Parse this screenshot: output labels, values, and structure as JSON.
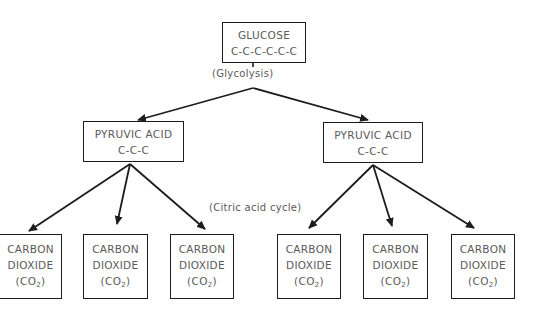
{
  "diagram": {
    "glucose": {
      "name": "GLUCOSE",
      "formula": "C-C-C-C-C-C"
    },
    "glycolysis_label": "(Glycolysis)",
    "citric_label": "(Citric acid cycle)",
    "pyruvic": [
      {
        "name": "PYRUVIC ACID",
        "formula": "C-C-C"
      },
      {
        "name": "PYRUVIC ACID",
        "formula": "C-C-C"
      }
    ],
    "co2": [
      {
        "line1": "CARBON",
        "line2": "DIOXIDE",
        "open": "(CO",
        "sub": "2",
        "close": ")"
      },
      {
        "line1": "CARBON",
        "line2": "DIOXIDE",
        "open": "(CO",
        "sub": "2",
        "close": ")"
      },
      {
        "line1": "CARBON",
        "line2": "DIOXIDE",
        "open": "(CO",
        "sub": "2",
        "close": ")"
      },
      {
        "line1": "CARBON",
        "line2": "DIOXIDE",
        "open": "(CO",
        "sub": "2",
        "close": ")"
      },
      {
        "line1": "CARBON",
        "line2": "DIOXIDE",
        "open": "(CO",
        "sub": "2",
        "close": ")"
      },
      {
        "line1": "CARBON",
        "line2": "DIOXIDE",
        "open": "(CO",
        "sub": "2",
        "close": ")"
      }
    ],
    "colors": {
      "line": "#1c1c1c",
      "text": "#5a5a5a",
      "background": "#ffffff"
    }
  }
}
